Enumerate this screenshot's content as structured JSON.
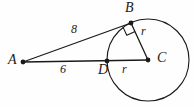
{
  "figure": {
    "type": "geometry-diagram",
    "background_color": "#fefefe",
    "stroke_color": "#1a1a1a",
    "width": 194,
    "height": 107,
    "points": [
      {
        "name": "A",
        "label": "A",
        "x": 23,
        "y": 62,
        "label_x": 8,
        "label_y": 54,
        "dot": true
      },
      {
        "name": "B",
        "label": "B",
        "x": 131,
        "y": 23,
        "label_x": 125,
        "label_y": 2,
        "dot": true
      },
      {
        "name": "C",
        "label": "C",
        "x": 148,
        "y": 60,
        "label_x": 157,
        "label_y": 52,
        "dot": true
      },
      {
        "name": "D",
        "label": "D",
        "x": 107,
        "y": 61,
        "label_x": 99,
        "label_y": 64,
        "dot": true
      }
    ],
    "segments": [
      {
        "name": "segment-AB",
        "from": "A",
        "to": "B",
        "label": "8",
        "label_x": 71,
        "label_y": 24
      },
      {
        "name": "segment-AC",
        "from": "A",
        "to": "C",
        "label": "6",
        "label_x": 60,
        "label_y": 64
      },
      {
        "name": "segment-BC",
        "from": "B",
        "to": "C",
        "label": "r",
        "label_x": 141,
        "label_y": 26
      },
      {
        "name": "segment-DC",
        "from": "D",
        "to": "C",
        "label": "r",
        "label_x": 122,
        "label_y": 64
      }
    ],
    "circle": {
      "name": "circle-C",
      "cx": 148,
      "cy": 60,
      "r": 41
    },
    "right_angle": {
      "name": "right-angle-at-B",
      "at": "B",
      "size": 9
    },
    "labels": {
      "point_a": "A",
      "point_b": "B",
      "point_c": "C",
      "point_d": "D",
      "len_ab": "8",
      "len_ad": "6",
      "radius_bc": "r",
      "radius_dc": "r"
    }
  }
}
